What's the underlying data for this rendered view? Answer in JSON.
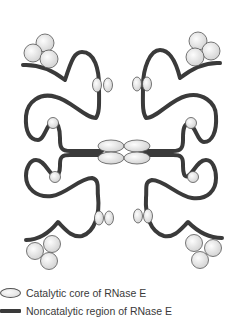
{
  "figure": {
    "colors": {
      "noncatalytic_line": "#3a3a3a",
      "catalytic_fill": "#e6e6e6",
      "outline": "#555555",
      "background": "#ffffff"
    }
  },
  "legend": {
    "items": [
      {
        "icon": "oval-icon",
        "label": "Catalytic core of RNase E"
      },
      {
        "icon": "thick-line-icon",
        "label": "Noncatalytic region of RNase E"
      }
    ]
  }
}
